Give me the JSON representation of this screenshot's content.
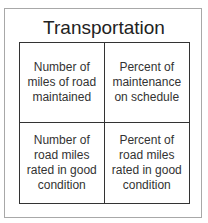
{
  "title": "Transportation",
  "cells": [
    {
      "label": "Number of miles of road maintained"
    },
    {
      "label": "Percent of maintenance on schedule"
    },
    {
      "label": "Number of road miles rated in good condition"
    },
    {
      "label": "Percent of road miles rated in good condition"
    }
  ]
}
